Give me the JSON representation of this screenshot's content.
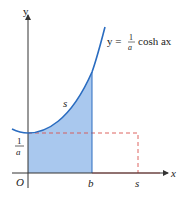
{
  "diagram": {
    "equation": {
      "lhs": "y =",
      "frac_num": "1",
      "frac_den": "a",
      "rhs": "cosh ax"
    },
    "axes": {
      "x_label": "x",
      "y_label": "y",
      "origin_label": "O"
    },
    "y_tick": {
      "num": "1",
      "den": "a"
    },
    "x_ticks": {
      "b": "b",
      "s": "s"
    },
    "arc_label": "s",
    "colors": {
      "curve": "#2a6cc0",
      "fill": "#a9c8ee",
      "dashed": "#d9534f",
      "axis": "#333333"
    }
  }
}
